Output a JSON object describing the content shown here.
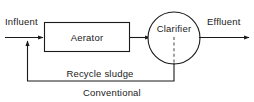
{
  "diagram": {
    "title": "Conventional",
    "caption": "Conventional",
    "type": "process-flow",
    "colors": {
      "stroke": "#1a1a1a",
      "dashed_stroke": "#555555",
      "background": "#ffffff",
      "text": "#1a1a1a"
    },
    "nodes": [
      {
        "id": "aerator",
        "label": "Aerator",
        "shape": "rectangle"
      },
      {
        "id": "clarifier",
        "label": "Clarifier",
        "shape": "circle"
      }
    ],
    "flow_labels": {
      "inlet": "Influent",
      "outlet": "Effluent",
      "recycle": "Recycle sludge"
    },
    "edges": [
      {
        "from": "influent",
        "to": "aerator",
        "label": "Influent",
        "style": "solid",
        "arrow": true
      },
      {
        "from": "aerator",
        "to": "clarifier",
        "label": "",
        "style": "solid",
        "arrow": true
      },
      {
        "from": "clarifier",
        "to": "effluent",
        "label": "Effluent",
        "style": "solid",
        "arrow": true
      },
      {
        "from": "clarifier",
        "to": "influent",
        "label": "Recycle sludge",
        "style": "solid",
        "arrow": true
      },
      {
        "from": "clarifier-center",
        "to": "clarifier-bottom",
        "label": "",
        "style": "dashed",
        "arrow": false
      }
    ]
  }
}
